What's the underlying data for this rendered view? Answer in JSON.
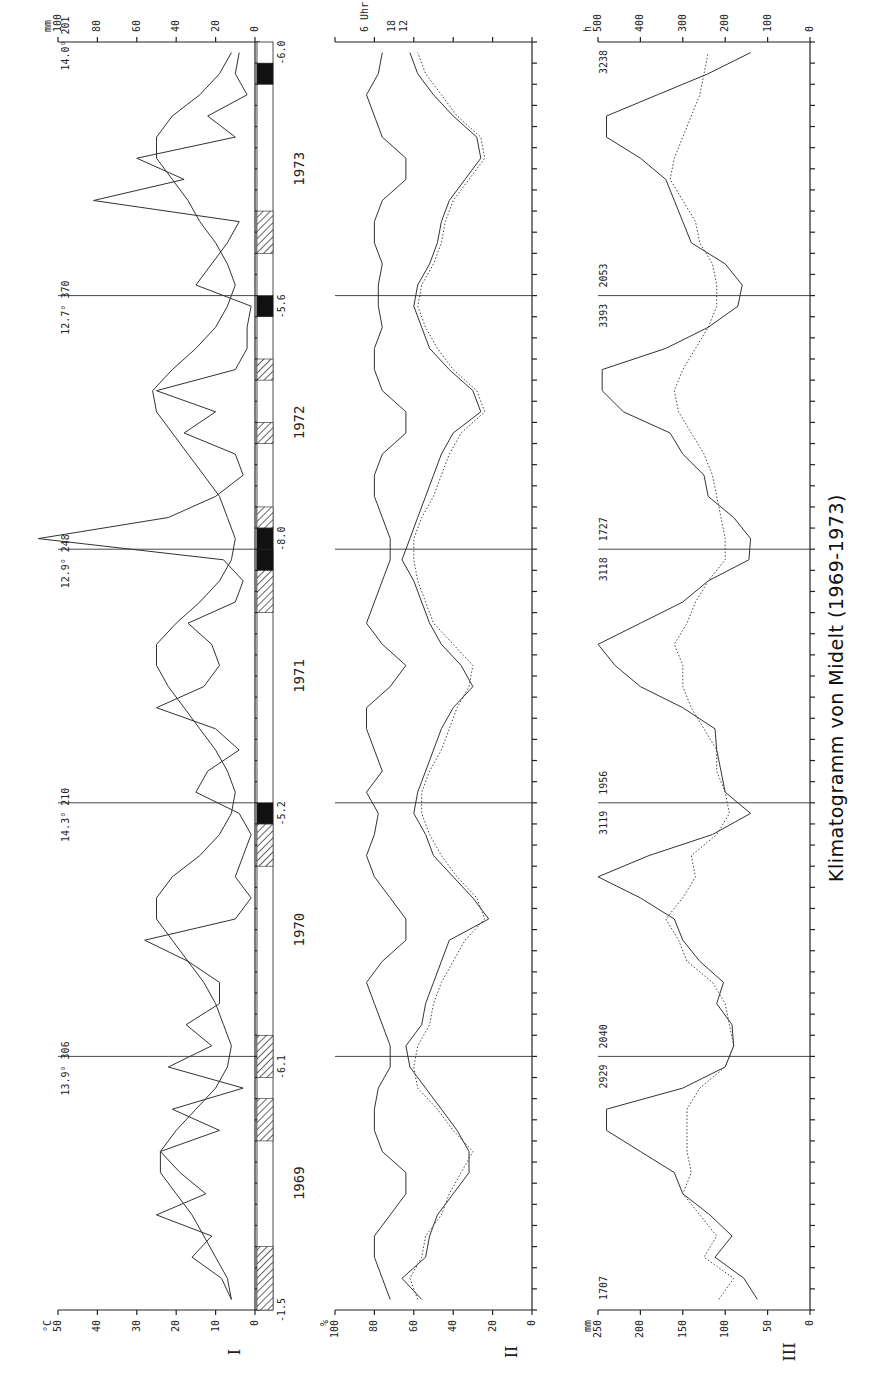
{
  "title": "Klimatogramm von Midelt (1969-1973)",
  "years": [
    "1969",
    "1970",
    "1971",
    "1972",
    "1973"
  ],
  "chart_data": [
    {
      "panel": "I",
      "type": "line",
      "title": "Temperature and precipitation",
      "left_axis": {
        "unit": "°C",
        "ticks": [
          0,
          10,
          20,
          30,
          40,
          50
        ],
        "range": [
          0,
          50
        ]
      },
      "right_axis": {
        "unit": "mm",
        "ticks": [
          0,
          20,
          40,
          60,
          80,
          100
        ],
        "range": [
          0,
          100
        ]
      },
      "x": "months Jan 1969 - Dec 1973",
      "series": [
        {
          "name": "Mean temperature (°C)",
          "style": "solid",
          "values": [
            6,
            7,
            10,
            13,
            16,
            20,
            24,
            24,
            20,
            15,
            10,
            7,
            6,
            8,
            10,
            13,
            17,
            21,
            25,
            25,
            21,
            14,
            9,
            6,
            5,
            7,
            10,
            14,
            18,
            22,
            25,
            25,
            20,
            14,
            9,
            6,
            5,
            7,
            9,
            13,
            17,
            21,
            25,
            26,
            21,
            15,
            10,
            7,
            5,
            7,
            10,
            14,
            17,
            21,
            25,
            25,
            21,
            14,
            9,
            6
          ]
        },
        {
          "name": "Precipitation (mm)",
          "style": "solid",
          "values": [
            12,
            17,
            32,
            22,
            50,
            25,
            38,
            48,
            18,
            42,
            6,
            44,
            22,
            35,
            18,
            18,
            34,
            56,
            10,
            2,
            10,
            6,
            2,
            8,
            30,
            24,
            8,
            20,
            50,
            26,
            18,
            22,
            34,
            10,
            6,
            16,
            110,
            44,
            20,
            6,
            10,
            36,
            20,
            50,
            10,
            4,
            4,
            2,
            30,
            22,
            14,
            8,
            82,
            36,
            60,
            10,
            24,
            4,
            10,
            8
          ]
        }
      ],
      "annual_annotations": [
        {
          "year": "1969",
          "text": "13.9° 306"
        },
        {
          "year": "1970",
          "text": "14.3° 210"
        },
        {
          "year": "1971",
          "text": "12.9° 248"
        },
        {
          "year": "1972",
          "text": "12.7° 370"
        },
        {
          "year": "1973",
          "text": "14.0° 201"
        }
      ],
      "frost_bars": {
        "legend": "hatched = frost possible, black = frost observed",
        "min_temps": [
          "-1.5",
          "-6.1",
          "-5.2",
          "-8.0",
          "-5.6",
          "-6.0"
        ],
        "segments": [
          {
            "from": 0,
            "to": 3,
            "kind": "hatched"
          },
          {
            "from": 9,
            "to": 11,
            "kind": "hatched"
          },
          {
            "from": 11,
            "to": 13,
            "kind": "hatched"
          },
          {
            "from": 21,
            "to": 23,
            "kind": "hatched"
          },
          {
            "from": 23,
            "to": 24,
            "kind": "black"
          },
          {
            "from": 33,
            "to": 36,
            "kind": "hatched"
          },
          {
            "from": 36,
            "to": 37,
            "kind": "hatched"
          },
          {
            "from": 35,
            "to": 36,
            "kind": "black"
          },
          {
            "from": 37,
            "to": 38,
            "kind": "black"
          },
          {
            "from": 36,
            "to": 37,
            "kind": "hatched"
          },
          {
            "from": 38,
            "to": 39,
            "kind": "hatched"
          },
          {
            "from": 41,
            "to": 42,
            "kind": "hatched"
          },
          {
            "from": 46,
            "to": 48,
            "kind": "hatched"
          },
          {
            "from": 48,
            "to": 49,
            "kind": "black"
          },
          {
            "from": 58,
            "to": 59,
            "kind": "black"
          },
          {
            "from": 46,
            "to": 47,
            "kind": "hatched"
          }
        ]
      }
    },
    {
      "panel": "II",
      "type": "line",
      "title": "Relative humidity",
      "left_axis": {
        "unit": "%",
        "ticks": [
          0,
          20,
          40,
          60,
          80,
          100
        ],
        "range": [
          0,
          100
        ]
      },
      "right_labels": [
        "6 Uhr",
        "18",
        "12"
      ],
      "series": [
        {
          "name": "6 Uhr",
          "style": "solid",
          "values": [
            72,
            76,
            80,
            80,
            72,
            64,
            64,
            76,
            80,
            80,
            78,
            72,
            72,
            76,
            80,
            84,
            76,
            64,
            64,
            72,
            80,
            84,
            80,
            78,
            84,
            76,
            80,
            84,
            84,
            72,
            64,
            76,
            84,
            80,
            76,
            72,
            72,
            76,
            80,
            80,
            76,
            64,
            64,
            76,
            80,
            80,
            76,
            78,
            78,
            76,
            80,
            80,
            76,
            64,
            64,
            76,
            80,
            84,
            78,
            76
          ]
        },
        {
          "name": "18 Uhr",
          "style": "solid",
          "values": [
            56,
            66,
            54,
            52,
            48,
            40,
            32,
            32,
            38,
            46,
            54,
            62,
            64,
            56,
            54,
            50,
            46,
            42,
            22,
            30,
            40,
            50,
            54,
            60,
            58,
            54,
            50,
            46,
            40,
            30,
            36,
            46,
            52,
            56,
            60,
            66,
            62,
            58,
            54,
            50,
            46,
            40,
            26,
            30,
            42,
            52,
            56,
            60,
            58,
            52,
            48,
            46,
            42,
            34,
            26,
            28,
            40,
            50,
            58,
            62
          ]
        },
        {
          "name": "12 Uhr",
          "style": "dotted",
          "values": [
            58,
            62,
            56,
            54,
            46,
            42,
            36,
            30,
            40,
            48,
            58,
            60,
            58,
            52,
            50,
            46,
            40,
            34,
            24,
            28,
            38,
            46,
            52,
            56,
            56,
            52,
            46,
            42,
            38,
            32,
            30,
            40,
            50,
            54,
            58,
            60,
            60,
            56,
            50,
            46,
            42,
            36,
            24,
            28,
            40,
            48,
            54,
            58,
            56,
            50,
            46,
            44,
            40,
            32,
            24,
            26,
            38,
            46,
            54,
            58
          ]
        }
      ]
    },
    {
      "panel": "III",
      "type": "line",
      "title": "Evaporation and sunshine",
      "left_axis": {
        "unit": "mm",
        "ticks": [
          0,
          50,
          100,
          150,
          200,
          250
        ],
        "range": [
          0,
          250
        ]
      },
      "right_axis": {
        "unit": "h",
        "ticks": [
          0,
          100,
          200,
          300,
          400,
          500
        ],
        "range": [
          0,
          500
        ]
      },
      "series": [
        {
          "name": "Evaporation (mm)",
          "style": "solid",
          "values": [
            62,
            78,
            112,
            92,
            118,
            150,
            160,
            200,
            240,
            240,
            150,
            100,
            90,
            92,
            110,
            102,
            130,
            150,
            160,
            200,
            250,
            190,
            115,
            70,
            100,
            105,
            110,
            112,
            150,
            200,
            230,
            250,
            200,
            150,
            120,
            72,
            70,
            90,
            120,
            125,
            150,
            165,
            220,
            245,
            245,
            170,
            120,
            85,
            80,
            100,
            140,
            150,
            160,
            170,
            200,
            240,
            240,
            180,
            120,
            70
          ]
        },
        {
          "name": "Sunshine (h)",
          "style": "dotted",
          "values": [
            215,
            180,
            250,
            220,
            260,
            300,
            280,
            290,
            290,
            290,
            260,
            200,
            180,
            190,
            200,
            230,
            290,
            310,
            340,
            300,
            270,
            280,
            220,
            190,
            200,
            220,
            220,
            250,
            280,
            300,
            300,
            320,
            290,
            270,
            240,
            200,
            200,
            210,
            220,
            230,
            250,
            280,
            310,
            320,
            300,
            270,
            240,
            220,
            220,
            230,
            260,
            270,
            300,
            330,
            320,
            300,
            280,
            260,
            250,
            240
          ]
        }
      ],
      "annual_annotations": [
        {
          "year": "1969",
          "left": "1707",
          "right": ""
        },
        {
          "year": "1969/70",
          "left": "2929",
          "right": "2040"
        },
        {
          "year": "1970/71",
          "left": "3119",
          "right": "1956"
        },
        {
          "year": "1971/72",
          "left": "3118",
          "right": "1727"
        },
        {
          "year": "1972/73",
          "left": "3393",
          "right": "2053"
        },
        {
          "year": "1973",
          "left": "3238",
          "right": ""
        }
      ]
    }
  ]
}
